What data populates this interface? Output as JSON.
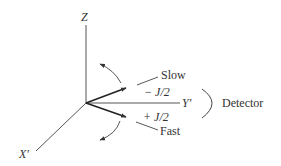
{
  "diagram": {
    "axes": {
      "z_label": "Z",
      "y_label": "Y'",
      "x_label": "X'"
    },
    "beams": {
      "slow_label": "Slow",
      "fast_label": "Fast",
      "minus_label": "− J/2",
      "plus_label": "+ J/2"
    },
    "detector_label": "Detector",
    "colors": {
      "line": "#333333",
      "text": "#333333"
    }
  }
}
